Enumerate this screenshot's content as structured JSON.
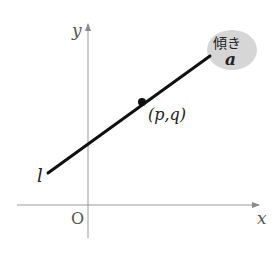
{
  "diagram": {
    "type": "coordinate-plane-line",
    "axes": {
      "x_label": "x",
      "y_label": "y",
      "origin_label": "O",
      "axis_color": "#999999"
    },
    "line": {
      "name": "l",
      "color": "#111111",
      "passes_through": {
        "label": "(p,q)",
        "x_sym": "p",
        "y_sym": "q"
      }
    },
    "slope_bubble": {
      "title": "傾き",
      "value": "a",
      "fill": "#d6d6d6"
    }
  }
}
